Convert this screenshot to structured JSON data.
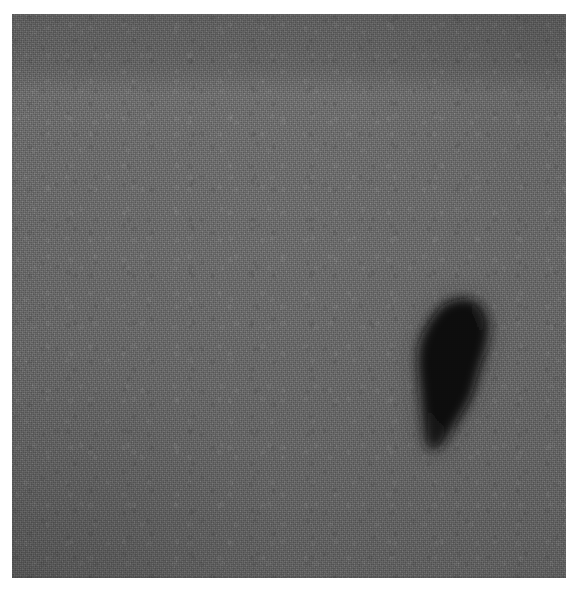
{
  "image": {
    "kind": "grayscale-micrograph",
    "description": "Uniform grainy grey field with a single dark irregular inclusion near the centre-left",
    "canvas": {
      "width": 579,
      "height": 590
    },
    "margin_color": "#ffffff",
    "plate": {
      "name": "grey-field",
      "left": 12,
      "top": 14,
      "width": 554,
      "height": 564,
      "base_color": "#6a6a6a",
      "darkest_tone": "#4e4e4e",
      "lightest_tone": "#7c7c7c",
      "texture": "fine film grain",
      "banding": "slight lighter horizontal band near the upper third, gradual darkening toward the bottom edge",
      "vignette": "soft darkening at the bottom-left corner and outer edges"
    },
    "feature": {
      "name": "dark-inclusion",
      "label": "dark particle",
      "shape": "rounded teardrop / pear outline, apex upper-centre, widest on the right, tapering to a blunt point at the lower-left",
      "core_color": "#0a0a0a",
      "halo_color": "#2c2c2c",
      "edge": "soft, diffuse",
      "bbox": {
        "x": 218,
        "y": 297,
        "width": 64,
        "height": 73
      },
      "center": {
        "x": 249,
        "y": 332
      }
    }
  },
  "feature_outline": {
    "comment": "Polygon points in plate-local coordinates (plate origin 12,14) tracing the inclusion silhouette",
    "points": "232,5 243,2 253,3 261,7 266,14 270,25 270,37 268,48 265,59 261,71 258,82 255,93 251,103 246,112 241,120 236,128 231,136 226,144 221,150 216,153 211,151 208,145 207,136 206,126 205,115 204,104 203,93 202,82 201,71 201,60 202,49 205,39 209,30 214,22 220,14 226,8"
  }
}
